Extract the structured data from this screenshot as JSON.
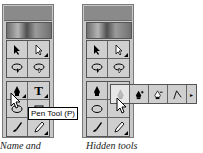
{
  "left_panel": {
    "tooltip": "Pen Tool (P)",
    "caption": "Name and",
    "tools": [
      {
        "name": "selection-arrow",
        "icon": "arrow-icon"
      },
      {
        "name": "direct-selection",
        "icon": "hollow-arrow-icon"
      },
      {
        "name": "lasso",
        "icon": "lasso-icon"
      },
      {
        "name": "magic-lasso",
        "icon": "lasso-icon"
      },
      {
        "name": "pen",
        "icon": "pen-icon"
      },
      {
        "name": "type",
        "icon": "type-icon",
        "label": "T"
      },
      {
        "name": "ellipse",
        "icon": "ellipse-icon"
      },
      {
        "name": "rectangle",
        "icon": "rectangle-icon"
      },
      {
        "name": "brush",
        "icon": "brush-icon"
      },
      {
        "name": "pencil",
        "icon": "pencil-icon"
      }
    ]
  },
  "right_panel": {
    "caption": "Hidden tools",
    "flyout": [
      {
        "name": "pen",
        "icon": "pen-icon",
        "selected": true
      },
      {
        "name": "add-anchor",
        "icon": "pen-plus-icon",
        "suffix": "+"
      },
      {
        "name": "delete-anchor",
        "icon": "pen-minus-icon",
        "suffix": "−"
      },
      {
        "name": "convert-anchor",
        "icon": "convert-anchor-icon"
      }
    ],
    "flyout_arrow": "▸"
  }
}
